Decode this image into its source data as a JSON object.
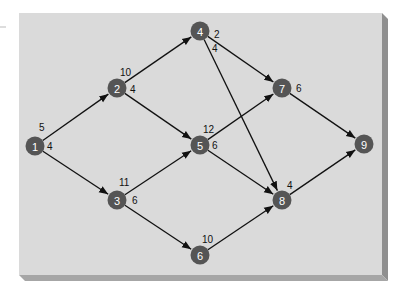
{
  "diagram": {
    "type": "directed-network",
    "panel": {
      "background": "#dadada",
      "bevel": "#8f8f8f"
    },
    "node_color": "#555555",
    "edge_color": "#111111",
    "nodes": [
      {
        "id": "1",
        "label": "1",
        "x": 35,
        "y": 146
      },
      {
        "id": "2",
        "label": "2",
        "x": 117,
        "y": 88
      },
      {
        "id": "3",
        "label": "3",
        "x": 117,
        "y": 200
      },
      {
        "id": "4",
        "label": "4",
        "x": 200,
        "y": 31
      },
      {
        "id": "5",
        "label": "5",
        "x": 200,
        "y": 145
      },
      {
        "id": "6",
        "label": "6",
        "x": 200,
        "y": 255
      },
      {
        "id": "7",
        "label": "7",
        "x": 282,
        "y": 88
      },
      {
        "id": "8",
        "label": "8",
        "x": 282,
        "y": 200
      },
      {
        "id": "9",
        "label": "9",
        "x": 364,
        "y": 144
      }
    ],
    "edges": [
      {
        "from": "1",
        "to": "2",
        "weight": "5"
      },
      {
        "from": "1",
        "to": "3",
        "weight": "4"
      },
      {
        "from": "2",
        "to": "4",
        "weight": "10"
      },
      {
        "from": "2",
        "to": "5",
        "weight": "4"
      },
      {
        "from": "3",
        "to": "5",
        "weight": "11"
      },
      {
        "from": "3",
        "to": "6",
        "weight": "6"
      },
      {
        "from": "4",
        "to": "7",
        "weight": "2"
      },
      {
        "from": "4",
        "to": "8",
        "weight": "4"
      },
      {
        "from": "5",
        "to": "7",
        "weight": "12"
      },
      {
        "from": "5",
        "to": "8",
        "weight": "6"
      },
      {
        "from": "6",
        "to": "8",
        "weight": "10"
      },
      {
        "from": "7",
        "to": "9",
        "weight": "6"
      },
      {
        "from": "8",
        "to": "9",
        "weight": "4"
      }
    ],
    "weight_labels": [
      {
        "text": "5",
        "x": 39,
        "y": 131
      },
      {
        "text": "4",
        "x": 47,
        "y": 150
      },
      {
        "text": "10",
        "x": 120,
        "y": 76
      },
      {
        "text": "4",
        "x": 130,
        "y": 93
      },
      {
        "text": "11",
        "x": 119,
        "y": 186
      },
      {
        "text": "6",
        "x": 132,
        "y": 204
      },
      {
        "text": "2",
        "x": 214,
        "y": 38
      },
      {
        "text": "4",
        "x": 212,
        "y": 52
      },
      {
        "text": "12",
        "x": 203,
        "y": 133
      },
      {
        "text": "6",
        "x": 212,
        "y": 149
      },
      {
        "text": "6",
        "x": 296,
        "y": 92
      },
      {
        "text": "10",
        "x": 202,
        "y": 243
      },
      {
        "text": "4",
        "x": 287,
        "y": 189
      }
    ]
  }
}
